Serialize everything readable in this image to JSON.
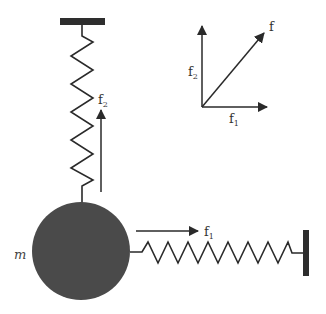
{
  "diagram": {
    "mass_label": "m",
    "vertical_force_label": "f",
    "vertical_force_sub": "2",
    "horizontal_force_label": "f",
    "horizontal_force_sub": "1",
    "vector_diagram": {
      "resultant_label": "f",
      "vertical_label": "f",
      "vertical_sub": "2",
      "horizontal_label": "f",
      "horizontal_sub": "1"
    },
    "colors": {
      "stroke": "#2a2a2a",
      "mass_fill": "#4a4a4a",
      "support_fill": "#2e2e2e"
    }
  }
}
